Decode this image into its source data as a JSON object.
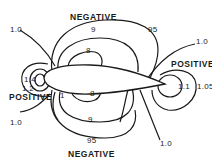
{
  "diagram": {
    "title": "",
    "colors": {
      "line": "#1a1a1a",
      "background": "#ffffff"
    },
    "regions": {
      "top": "NEGATIVE",
      "bottom": "NEGATIVE",
      "leading_edge": "POSITIVE",
      "trailing_edge": "POSITIVE"
    },
    "labels": {
      "top_negative": "NEGATIVE",
      "bottom_negative": "NEGATIVE",
      "left_positive": "POSITIVE",
      "right_positive": "POSITIVE",
      "top_9": "9",
      "top_95": "95",
      "top_8": "8",
      "bottom_8": "8",
      "bottom_9": "9",
      "bottom_95": "95",
      "bottom_1": "1",
      "left_top_10": "1.0",
      "left_bottom_10": "1.0",
      "left_14": "1.4",
      "left_12": "1.2",
      "right_top_10": "1.0",
      "right_bottom_10": "1.0",
      "right_11": "1.1",
      "right_105": "1.05"
    }
  }
}
